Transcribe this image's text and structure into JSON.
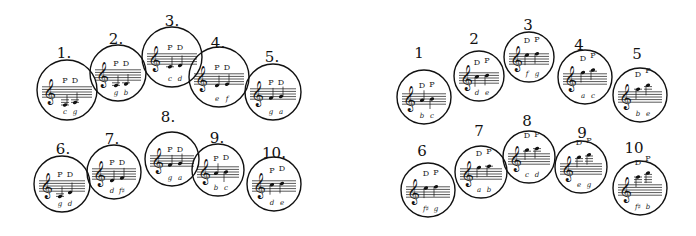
{
  "figure": {
    "left_group": {
      "label_suffix": ".",
      "items": [
        {
          "number": "1",
          "cx": 67,
          "cy": 90,
          "r": 30,
          "lx": 64,
          "ly": 58,
          "pd": [
            "P",
            "D"
          ],
          "notes": [
            {
              "letter": "c",
              "pos": -5
            },
            {
              "letter": "g",
              "pos": -3
            }
          ]
        },
        {
          "number": "2",
          "cx": 118,
          "cy": 73,
          "r": 28,
          "lx": 116,
          "ly": 44,
          "pd": [
            "P",
            "D"
          ],
          "notes": [
            {
              "letter": "g",
              "pos": -3
            },
            {
              "letter": "b",
              "pos": -2
            }
          ]
        },
        {
          "number": "3",
          "cx": 172,
          "cy": 57,
          "r": 30,
          "lx": 172,
          "ly": 26,
          "pd": [
            "P",
            "D"
          ],
          "notes": [
            {
              "letter": "c",
              "pos": -1
            },
            {
              "letter": "d",
              "pos": 0
            }
          ]
        },
        {
          "number": "4",
          "cx": 219,
          "cy": 77,
          "r": 30,
          "lx": 218,
          "ly": 48,
          "pd": [
            "P",
            "D"
          ],
          "notes": [
            {
              "letter": "e",
              "pos": 0
            },
            {
              "letter": "f",
              "pos": 1
            }
          ]
        },
        {
          "number": "5",
          "cx": 273,
          "cy": 92,
          "r": 28,
          "lx": 272,
          "ly": 62,
          "pd": [
            "P",
            "D"
          ],
          "notes": [
            {
              "letter": "g",
              "pos": 2
            },
            {
              "letter": "a",
              "pos": 3
            }
          ]
        },
        {
          "number": "6",
          "cx": 62,
          "cy": 184,
          "r": 28,
          "lx": 63,
          "ly": 154,
          "pd": [
            "P",
            "D"
          ],
          "notes": [
            {
              "letter": "g",
              "pos": -3
            },
            {
              "letter": "d",
              "pos": 0
            }
          ]
        },
        {
          "number": "7",
          "cx": 114,
          "cy": 172,
          "r": 27,
          "lx": 112,
          "ly": 144,
          "pd": [
            "P",
            "D"
          ],
          "notes": [
            {
              "letter": "d",
              "pos": 0
            },
            {
              "letter": "f♯",
              "pos": 2
            }
          ]
        },
        {
          "number": "8",
          "cx": 172,
          "cy": 159,
          "r": 27,
          "lx": 168,
          "ly": 122,
          "pd": [
            "P",
            "D"
          ],
          "notes": [
            {
              "letter": "g",
              "pos": 2
            },
            {
              "letter": "a",
              "pos": 3
            }
          ]
        },
        {
          "number": "9",
          "cx": 218,
          "cy": 170,
          "r": 26,
          "lx": 217,
          "ly": 143,
          "pd": [
            "P",
            "D"
          ],
          "notes": [
            {
              "letter": "b",
              "pos": 4
            },
            {
              "letter": "c",
              "pos": 5
            }
          ]
        },
        {
          "number": "10",
          "cx": 274,
          "cy": 184,
          "r": 27,
          "lx": 274,
          "ly": 158,
          "pd": [
            "P",
            "D"
          ],
          "notes": [
            {
              "letter": "d",
              "pos": 6
            },
            {
              "letter": "e",
              "pos": 7
            }
          ]
        }
      ]
    },
    "right_group": {
      "label_suffix": "",
      "items": [
        {
          "number": "1",
          "cx": 424,
          "cy": 97,
          "r": 27,
          "lx": 419,
          "ly": 58,
          "pd": [
            "D",
            "P"
          ],
          "notes": [
            {
              "letter": "b",
              "pos": 4
            },
            {
              "letter": "c",
              "pos": 5
            }
          ]
        },
        {
          "number": "2",
          "cx": 479,
          "cy": 76,
          "r": 25,
          "lx": 474,
          "ly": 44,
          "pd": [
            "D",
            "P"
          ],
          "notes": [
            {
              "letter": "d",
              "pos": 6
            },
            {
              "letter": "e",
              "pos": 7
            }
          ]
        },
        {
          "number": "3",
          "cx": 529,
          "cy": 57,
          "r": 25,
          "lx": 528,
          "ly": 30,
          "pd": [
            "D",
            "P"
          ],
          "notes": [
            {
              "letter": "f",
              "pos": 8
            },
            {
              "letter": "g",
              "pos": 9
            }
          ]
        },
        {
          "number": "4",
          "cx": 585,
          "cy": 77,
          "r": 27,
          "lx": 579,
          "ly": 50,
          "pd": [
            "D",
            "P"
          ],
          "notes": [
            {
              "letter": "a",
              "pos": 10
            },
            {
              "letter": "c",
              "pos": 12
            }
          ]
        },
        {
          "number": "5",
          "cx": 640,
          "cy": 95,
          "r": 27,
          "lx": 637,
          "ly": 59,
          "pd": [
            "D",
            "P"
          ],
          "notes": [
            {
              "letter": "b",
              "pos": 11
            },
            {
              "letter": "e",
              "pos": 14
            }
          ]
        },
        {
          "number": "6",
          "cx": 428,
          "cy": 190,
          "r": 27,
          "lx": 422,
          "ly": 156,
          "pd": [
            "D",
            "P"
          ],
          "notes": [
            {
              "letter": "f♯",
              "pos": 8
            },
            {
              "letter": "g",
              "pos": 9
            }
          ]
        },
        {
          "number": "7",
          "cx": 481,
          "cy": 172,
          "r": 26,
          "lx": 479,
          "ly": 136,
          "pd": [
            "D",
            "P"
          ],
          "notes": [
            {
              "letter": "a",
              "pos": 10
            },
            {
              "letter": "b",
              "pos": 11
            }
          ]
        },
        {
          "number": "8",
          "cx": 529,
          "cy": 157,
          "r": 26,
          "lx": 527,
          "ly": 126,
          "pd": [
            "D",
            "P"
          ],
          "notes": [
            {
              "letter": "c",
              "pos": 12
            },
            {
              "letter": "d",
              "pos": 13
            }
          ]
        },
        {
          "number": "9",
          "cx": 581,
          "cy": 167,
          "r": 26,
          "lx": 582,
          "ly": 138,
          "pd": [
            "D",
            "P"
          ],
          "notes": [
            {
              "letter": "e",
              "pos": 14
            },
            {
              "letter": "g",
              "pos": 16
            }
          ]
        },
        {
          "number": "10",
          "cx": 640,
          "cy": 188,
          "r": 27,
          "lx": 634,
          "ly": 153,
          "pd": [
            "D",
            "P"
          ],
          "notes": [
            {
              "letter": "f♯",
              "pos": 15
            },
            {
              "letter": "b",
              "pos": 18
            }
          ]
        }
      ]
    },
    "colors": {
      "ink": "#111111",
      "background": "#ffffff"
    },
    "clef_glyph": "𝄞"
  }
}
